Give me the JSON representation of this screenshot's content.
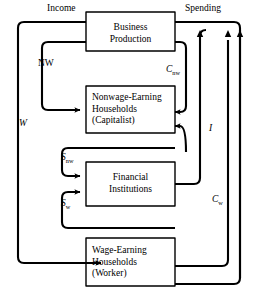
{
  "diagram": {
    "type": "flow-diagram",
    "stroke_color": "#000000",
    "background_color": "#ffffff",
    "boxes": [
      {
        "id": "business-production",
        "lines": [
          "Business",
          "Production"
        ],
        "align": "center"
      },
      {
        "id": "nonwage-households",
        "lines": [
          "Nonwage-Earning",
          "Households",
          "(Capitalist)"
        ],
        "align": "left"
      },
      {
        "id": "financial-institutions",
        "lines": [
          "Financial",
          "Institutions"
        ],
        "align": "center"
      },
      {
        "id": "wage-households",
        "lines": [
          "Wage-Earning",
          "Households",
          "(Worker)"
        ],
        "align": "left"
      }
    ],
    "flow_labels": [
      {
        "id": "income",
        "text": "Income",
        "style": "upright",
        "base": "Income",
        "sub": ""
      },
      {
        "id": "spending",
        "text": "Spending",
        "style": "upright",
        "base": "Spending",
        "sub": ""
      },
      {
        "id": "nw",
        "text": "NW",
        "style": "upright",
        "base": "NW",
        "sub": ""
      },
      {
        "id": "w",
        "text": "W",
        "style": "italic",
        "base": "W",
        "sub": ""
      },
      {
        "id": "c-nw",
        "text": "Cnw",
        "style": "italic",
        "base": "C",
        "sub": "nw"
      },
      {
        "id": "i",
        "text": "I",
        "style": "italic",
        "base": "I",
        "sub": ""
      },
      {
        "id": "s-nw",
        "text": "Snw",
        "style": "italic",
        "base": "S",
        "sub": "nw"
      },
      {
        "id": "s-w",
        "text": "Sw",
        "style": "italic",
        "base": "S",
        "sub": "w"
      },
      {
        "id": "c-w",
        "text": "Cw",
        "style": "italic",
        "base": "C",
        "sub": "w"
      }
    ]
  }
}
